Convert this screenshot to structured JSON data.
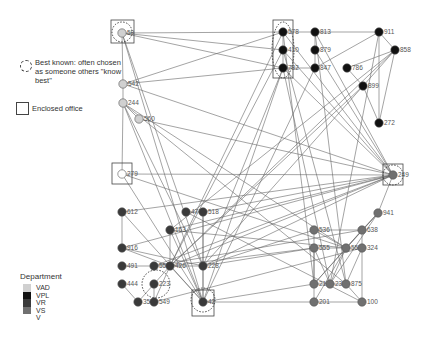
{
  "legend": {
    "best_known": "Best known: often chosen as someone others \"know best\"",
    "enclosed_office": "Enclosed office",
    "department_title": "Department",
    "departments": [
      {
        "code": "VAD",
        "color": "#d0d0d0"
      },
      {
        "code": "VPL",
        "color": "#111111"
      },
      {
        "code": "VR",
        "color": "#3a3a3a"
      },
      {
        "code": "VS",
        "color": "#707070"
      },
      {
        "code": "V",
        "color": "#ffffff"
      }
    ]
  },
  "nodes": [
    {
      "id": "59",
      "x": 122,
      "y": 33,
      "dept": "VAD",
      "office": true,
      "best": true
    },
    {
      "id": "542",
      "x": 123,
      "y": 84,
      "dept": "VAD"
    },
    {
      "id": "244",
      "x": 123,
      "y": 103,
      "dept": "VAD"
    },
    {
      "id": "560",
      "x": 139,
      "y": 119,
      "dept": "VAD"
    },
    {
      "id": "279",
      "x": 122,
      "y": 174,
      "dept": "V",
      "office": true
    },
    {
      "id": "578",
      "x": 283,
      "y": 32,
      "dept": "VPL",
      "office": true,
      "best": true
    },
    {
      "id": "410",
      "x": 283,
      "y": 50,
      "dept": "VPL"
    },
    {
      "id": "782",
      "x": 283,
      "y": 68,
      "dept": "VPL"
    },
    {
      "id": "813",
      "x": 315,
      "y": 32,
      "dept": "VPL"
    },
    {
      "id": "879",
      "x": 315,
      "y": 50,
      "dept": "VPL"
    },
    {
      "id": "847",
      "x": 315,
      "y": 68,
      "dept": "VPL"
    },
    {
      "id": "911",
      "x": 379,
      "y": 32,
      "dept": "VPL"
    },
    {
      "id": "858",
      "x": 395,
      "y": 50,
      "dept": "VPL"
    },
    {
      "id": "786",
      "x": 347,
      "y": 68,
      "dept": "VPL"
    },
    {
      "id": "899",
      "x": 363,
      "y": 86,
      "dept": "VPL"
    },
    {
      "id": "272",
      "x": 379,
      "y": 123,
      "dept": "VPL"
    },
    {
      "id": "249",
      "x": 393,
      "y": 175,
      "dept": "VS",
      "office": true,
      "best": true
    },
    {
      "id": "941",
      "x": 378,
      "y": 213,
      "dept": "VS"
    },
    {
      "id": "612",
      "x": 122,
      "y": 212,
      "dept": "VR"
    },
    {
      "id": "916",
      "x": 122,
      "y": 248,
      "dept": "VR"
    },
    {
      "id": "491",
      "x": 122,
      "y": 266,
      "dept": "VR"
    },
    {
      "id": "444",
      "x": 122,
      "y": 284,
      "dept": "VR"
    },
    {
      "id": "357",
      "x": 138,
      "y": 302,
      "dept": "VR"
    },
    {
      "id": "549",
      "x": 154,
      "y": 302,
      "dept": "VR"
    },
    {
      "id": "223",
      "x": 154,
      "y": 284,
      "dept": "VR",
      "best": true
    },
    {
      "id": "558",
      "x": 154,
      "y": 266,
      "dept": "VR"
    },
    {
      "id": "426",
      "x": 170,
      "y": 266,
      "dept": "VR"
    },
    {
      "id": "163",
      "x": 170,
      "y": 230,
      "dept": "VR"
    },
    {
      "id": "477",
      "x": 186,
      "y": 212,
      "dept": "VR"
    },
    {
      "id": "518",
      "x": 203,
      "y": 212,
      "dept": "VR"
    },
    {
      "id": "228",
      "x": 203,
      "y": 266,
      "dept": "VR"
    },
    {
      "id": "42",
      "x": 203,
      "y": 302,
      "dept": "VR",
      "office": true,
      "best": true
    },
    {
      "id": "536",
      "x": 314,
      "y": 230,
      "dept": "VS"
    },
    {
      "id": "638",
      "x": 362,
      "y": 230,
      "dept": "VS"
    },
    {
      "id": "555",
      "x": 314,
      "y": 248,
      "dept": "VS"
    },
    {
      "id": "553",
      "x": 346,
      "y": 248,
      "dept": "VS"
    },
    {
      "id": "324",
      "x": 362,
      "y": 248,
      "dept": "VS"
    },
    {
      "id": "217",
      "x": 314,
      "y": 284,
      "dept": "VS"
    },
    {
      "id": "238",
      "x": 330,
      "y": 284,
      "dept": "VS"
    },
    {
      "id": "875",
      "x": 346,
      "y": 284,
      "dept": "VS"
    },
    {
      "id": "201",
      "x": 314,
      "y": 302,
      "dept": "VS"
    },
    {
      "id": "100",
      "x": 362,
      "y": 302,
      "dept": "VS"
    }
  ],
  "edges": [
    [
      "59",
      "542"
    ],
    [
      "542",
      "244"
    ],
    [
      "244",
      "560"
    ],
    [
      "244",
      "279"
    ],
    [
      "59",
      "578"
    ],
    [
      "59",
      "410"
    ],
    [
      "59",
      "782"
    ],
    [
      "59",
      "42"
    ],
    [
      "59",
      "228"
    ],
    [
      "542",
      "578"
    ],
    [
      "542",
      "782"
    ],
    [
      "542",
      "249"
    ],
    [
      "244",
      "42"
    ],
    [
      "244",
      "228"
    ],
    [
      "244",
      "875"
    ],
    [
      "244",
      "553"
    ],
    [
      "560",
      "249"
    ],
    [
      "279",
      "249"
    ],
    [
      "279",
      "42"
    ],
    [
      "279",
      "553"
    ],
    [
      "578",
      "813"
    ],
    [
      "578",
      "410"
    ],
    [
      "410",
      "782"
    ],
    [
      "782",
      "847"
    ],
    [
      "813",
      "879"
    ],
    [
      "879",
      "847"
    ],
    [
      "813",
      "911"
    ],
    [
      "847",
      "911"
    ],
    [
      "911",
      "858"
    ],
    [
      "858",
      "786"
    ],
    [
      "786",
      "899"
    ],
    [
      "899",
      "272"
    ],
    [
      "858",
      "272"
    ],
    [
      "911",
      "272"
    ],
    [
      "858",
      "899"
    ],
    [
      "578",
      "249"
    ],
    [
      "410",
      "249"
    ],
    [
      "782",
      "249"
    ],
    [
      "813",
      "249"
    ],
    [
      "879",
      "249"
    ],
    [
      "578",
      "426"
    ],
    [
      "410",
      "426"
    ],
    [
      "782",
      "228"
    ],
    [
      "782",
      "42"
    ],
    [
      "847",
      "42"
    ],
    [
      "878",
      "553"
    ],
    [
      "578",
      "217"
    ],
    [
      "782",
      "238"
    ],
    [
      "410",
      "875"
    ],
    [
      "813",
      "875"
    ],
    [
      "899",
      "426"
    ],
    [
      "899",
      "228"
    ],
    [
      "858",
      "426"
    ],
    [
      "911",
      "238"
    ],
    [
      "249",
      "426"
    ],
    [
      "249",
      "228"
    ],
    [
      "249",
      "558"
    ],
    [
      "249",
      "163"
    ],
    [
      "249",
      "612"
    ],
    [
      "249",
      "916"
    ],
    [
      "249",
      "941"
    ],
    [
      "941",
      "638"
    ],
    [
      "941",
      "553"
    ],
    [
      "941",
      "238"
    ],
    [
      "941",
      "217"
    ],
    [
      "612",
      "916"
    ],
    [
      "916",
      "426"
    ],
    [
      "491",
      "558"
    ],
    [
      "444",
      "357"
    ],
    [
      "357",
      "223"
    ],
    [
      "223",
      "549"
    ],
    [
      "549",
      "426"
    ],
    [
      "223",
      "426"
    ],
    [
      "558",
      "426"
    ],
    [
      "426",
      "228"
    ],
    [
      "477",
      "518"
    ],
    [
      "518",
      "42"
    ],
    [
      "163",
      "42"
    ],
    [
      "163",
      "426"
    ],
    [
      "228",
      "42"
    ],
    [
      "518",
      "228"
    ],
    [
      "426",
      "42"
    ],
    [
      "612",
      "42"
    ],
    [
      "916",
      "228"
    ],
    [
      "518",
      "249"
    ],
    [
      "163",
      "858"
    ],
    [
      "536",
      "638"
    ],
    [
      "536",
      "553"
    ],
    [
      "555",
      "553"
    ],
    [
      "553",
      "324"
    ],
    [
      "638",
      "324"
    ],
    [
      "324",
      "100"
    ],
    [
      "536",
      "217"
    ],
    [
      "555",
      "217"
    ],
    [
      "555",
      "238"
    ],
    [
      "217",
      "238"
    ],
    [
      "238",
      "875"
    ],
    [
      "875",
      "100"
    ],
    [
      "201",
      "100"
    ],
    [
      "217",
      "201"
    ],
    [
      "553",
      "201"
    ],
    [
      "638",
      "217"
    ],
    [
      "553",
      "238"
    ],
    [
      "324",
      "875"
    ],
    [
      "228",
      "536"
    ],
    [
      "228",
      "555"
    ],
    [
      "426",
      "555"
    ],
    [
      "42",
      "201"
    ],
    [
      "42",
      "217"
    ],
    [
      "558",
      "638"
    ],
    [
      "163",
      "553"
    ],
    [
      "477",
      "100"
    ],
    [
      "549",
      "324"
    ]
  ]
}
